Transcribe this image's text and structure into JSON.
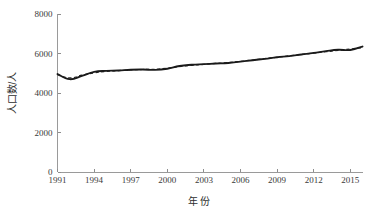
{
  "chart_data": {
    "type": "line",
    "title": "",
    "subtitle": "",
    "xlabel": "年  份",
    "ylabel": "人口数/人",
    "xlim": [
      1991,
      2016
    ],
    "ylim": [
      0,
      8000
    ],
    "grid": false,
    "legend": "none",
    "x_ticks": [
      "1991",
      "1994",
      "1997",
      "2000",
      "2003",
      "2006",
      "2009",
      "2012",
      "2015"
    ],
    "x_tick_values": [
      1991,
      1994,
      1997,
      2000,
      2003,
      2006,
      2009,
      2012,
      2015
    ],
    "y_ticks": [
      "0",
      "2000",
      "4000",
      "6000",
      "8000"
    ],
    "y_tick_values": [
      0,
      2000,
      4000,
      6000,
      8000
    ],
    "x": [
      1991,
      1992,
      1993,
      1994,
      1995,
      1996,
      1997,
      1998,
      1999,
      2000,
      2001,
      2002,
      2003,
      2004,
      2005,
      2006,
      2007,
      2008,
      2009,
      2010,
      2011,
      2012,
      2013,
      2014,
      2015,
      2016
    ],
    "series": [
      {
        "name": "实际人口数",
        "style": "solid",
        "color": "#1a1a1a",
        "values": [
          4960,
          4700,
          4870,
          5070,
          5120,
          5140,
          5180,
          5190,
          5170,
          5230,
          5370,
          5430,
          5460,
          5490,
          5520,
          5590,
          5660,
          5730,
          5810,
          5870,
          5950,
          6030,
          6120,
          6190,
          6180,
          6350
        ]
      },
      {
        "name": "拟合人口数",
        "style": "dashed",
        "color": "#2b2b2b",
        "values": [
          4930,
          4760,
          4900,
          5020,
          5090,
          5130,
          5170,
          5190,
          5200,
          5260,
          5340,
          5400,
          5450,
          5500,
          5540,
          5600,
          5670,
          5740,
          5810,
          5880,
          5950,
          6020,
          6090,
          6160,
          6230,
          6300
        ]
      }
    ]
  },
  "axis": {
    "x_title": "年  份",
    "y_title": "人口数/人"
  }
}
